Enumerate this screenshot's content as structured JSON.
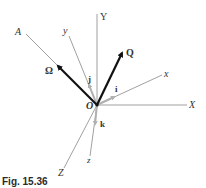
{
  "figure": {
    "caption": "Fig. 15.36",
    "origin_label": "O",
    "fixed_axes": {
      "X": "X",
      "Y": "Y",
      "Z": "Z"
    },
    "rotating_axes": {
      "x": "x",
      "y": "y",
      "z": "z"
    },
    "unit_vectors": {
      "i": "i",
      "j": "j",
      "k": "k"
    },
    "vectors": {
      "omega": "Ω",
      "Q": "Q"
    },
    "line_A": "A"
  },
  "colors": {
    "axis_line": "#888888",
    "dark_vector": "#111111",
    "unit_vector": "#b0b0b0",
    "text": "#333333"
  }
}
